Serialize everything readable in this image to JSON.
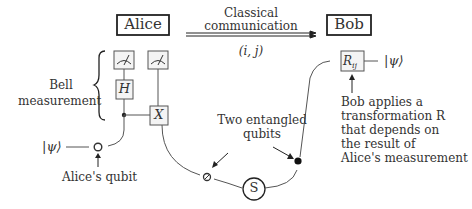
{
  "parties": {
    "alice": "Alice",
    "bob": "Bob"
  },
  "channel": {
    "line1": "Classical",
    "line2": "communication",
    "payload": "(i, j)"
  },
  "bell": {
    "line1": "Bell",
    "line2": "measurement"
  },
  "gates": {
    "hadamard": "H",
    "cnot_target": "X",
    "bob_gate": "R",
    "bob_gate_sub": "ij",
    "source": "S"
  },
  "states": {
    "input": "|ψ⟩",
    "output": "|ψ⟩"
  },
  "annotations": {
    "alice_qubit": "Alice's qubit",
    "entangled_line1": "Two entangled",
    "entangled_line2": "qubits",
    "bob_line1": "Bob applies a",
    "bob_line2": "transformation R",
    "bob_line3": "that depends on",
    "bob_line4": "the result of",
    "bob_line5": "Alice's measurement"
  }
}
